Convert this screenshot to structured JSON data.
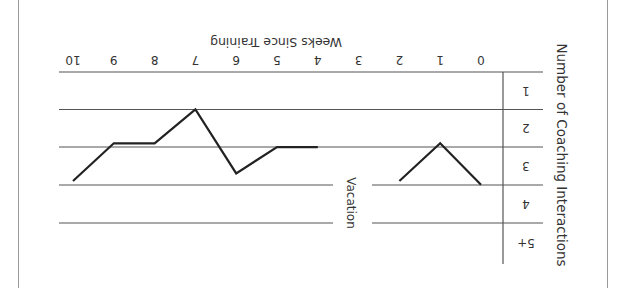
{
  "chart_data": {
    "type": "line",
    "orientation_note": "figure rendered rotated 180 degrees",
    "title": "",
    "xlabel": "Weeks Since Training",
    "ylabel": "Number of Coaching Interactions",
    "x_ticks": [
      "0",
      "1",
      "2",
      "3",
      "4",
      "5",
      "6",
      "7",
      "8",
      "9",
      "10"
    ],
    "y_ticks": [
      "1",
      "2",
      "3",
      "4",
      "5+"
    ],
    "annotation": "Vacation",
    "annotation_at_week": 3,
    "grid": true,
    "series": [
      {
        "name": "Coaching Interactions",
        "segments": [
          {
            "x": [
              0,
              1,
              2
            ],
            "values": [
              3.5,
              2.4,
              3.4
            ]
          },
          {
            "x": [
              4,
              5,
              6,
              7,
              8,
              9,
              10
            ],
            "values": [
              2.5,
              2.5,
              3.2,
              1.5,
              2.4,
              2.4,
              3.4
            ]
          }
        ]
      }
    ],
    "xlim": [
      0,
      10
    ],
    "ylim": [
      1,
      5
    ]
  },
  "colors": {
    "line": "#222222",
    "grid": "#555555",
    "frame": "#9a9a9a",
    "text": "#333333"
  }
}
